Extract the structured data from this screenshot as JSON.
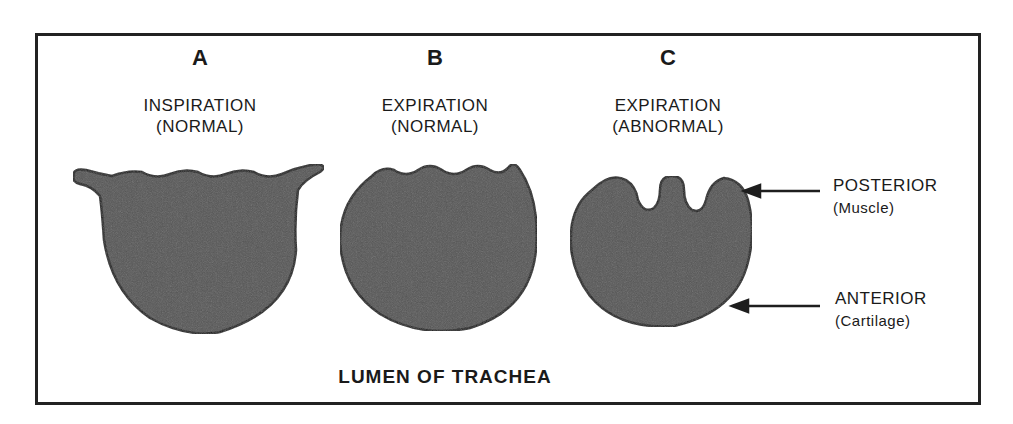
{
  "figure": {
    "caption": "LUMEN OF TRACHEA",
    "panels": [
      {
        "letter": "A",
        "line1": "INSPIRATION",
        "line2": "(NORMAL)",
        "shape": "cup-shaped-lumen"
      },
      {
        "letter": "B",
        "line1": "EXPIRATION",
        "line2": "(NORMAL)",
        "shape": "round-lumen-wavy-top"
      },
      {
        "letter": "C",
        "line1": "EXPIRATION",
        "line2": "(ABNORMAL)",
        "shape": "collapsed-lumen-with-invagination"
      }
    ],
    "annotations": [
      {
        "title": "POSTERIOR",
        "sub": "(Muscle)",
        "arrow": "arrow-left"
      },
      {
        "title": "ANTERIOR",
        "sub": "(Cartilage)",
        "arrow": "arrow-left"
      }
    ],
    "colors": {
      "fill": "#555555",
      "outline": "#1e1e1e",
      "frame": "#222222"
    }
  }
}
